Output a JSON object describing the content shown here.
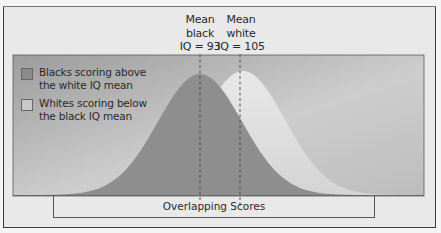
{
  "chart_data": {
    "type": "area",
    "title": "",
    "xlabel": "",
    "ylabel": "",
    "series": [
      {
        "name": "Black IQ distribution",
        "mean": 93,
        "color": "#8f8f8f",
        "outline": "#6e6e6e"
      },
      {
        "name": "White IQ distribution",
        "mean": 105,
        "color": "#dedede"
      }
    ],
    "annotations": [
      {
        "label_lines": [
          "Mean",
          "black",
          "IQ = 93"
        ],
        "x_value": 93
      },
      {
        "label_lines": [
          "Mean",
          "white",
          "IQ = 105"
        ],
        "x_value": 105
      }
    ],
    "legend": [
      {
        "label_lines": [
          "Blacks scoring above",
          "the white IQ mean"
        ],
        "swatch": "#8a8a8a"
      },
      {
        "label_lines": [
          "Whites scoring below",
          "the black IQ mean"
        ],
        "swatch": "#c9c9c9"
      }
    ],
    "bracket_label": "Overlapping Scores",
    "grid": false,
    "legend_position": "upper-left"
  },
  "labels": {
    "mean_black": [
      "Mean",
      "black",
      "IQ = 93"
    ],
    "mean_white": [
      "Mean",
      "white",
      "IQ = 105"
    ],
    "overlap": "Overlapping Scores"
  },
  "legend": {
    "item1": {
      "line1": "Blacks scoring above",
      "line2": "the white IQ mean"
    },
    "item2": {
      "line1": "Whites scoring below",
      "line2": "the black IQ mean"
    }
  },
  "colors": {
    "panel_dark": "#9a9a9a",
    "panel_light": "#cfcfcf",
    "black_curve_fill": "#8c8c8c",
    "white_curve_fill": "#e2e2e2",
    "overlap_fill": "#bdbdbd",
    "curve_stroke": "#707070"
  }
}
